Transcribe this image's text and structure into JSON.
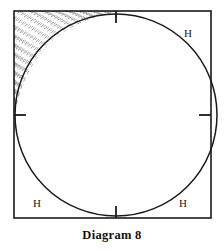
{
  "figure": {
    "caption": "Diagram 8",
    "labels": {
      "top_right": "H",
      "bottom_left": "H",
      "bottom_right": "H"
    },
    "geometry": {
      "square": {
        "x": 14,
        "y": 11,
        "width": 197,
        "height": 207
      },
      "circle": {
        "cx": 116,
        "cy": 115,
        "r": 101
      },
      "tick_marks": [
        {
          "name": "top-tangent-tick",
          "x1": 116,
          "y1": 11,
          "x2": 116,
          "y2": 22
        },
        {
          "name": "bottom-tangent-tick",
          "x1": 116,
          "y1": 207,
          "x2": 116,
          "y2": 218
        },
        {
          "name": "left-tangent-tick",
          "x1": 14,
          "y1": 115,
          "x2": 25,
          "y2": 115
        },
        {
          "name": "right-tangent-tick",
          "x1": 200,
          "y1": 115,
          "x2": 211,
          "y2": 115
        }
      ],
      "hatched_region": "top-left corner between square corner and circle arc"
    },
    "colors": {
      "stroke": "#1a1a1a",
      "hatch": "#8a8a8a",
      "background": "#ffffff"
    }
  }
}
